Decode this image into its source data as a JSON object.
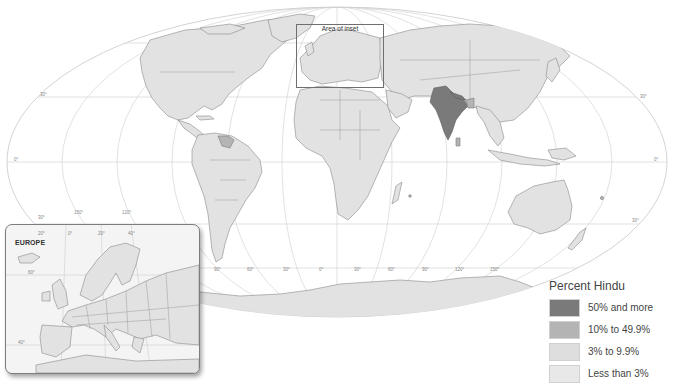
{
  "map": {
    "title": "Percent Hindu",
    "projection": "world ellipse (Mollweide-style)",
    "highlighted_regions": {
      "50% and more": [
        "India",
        "Nepal"
      ],
      "10% to 49.9%": [
        "Bangladesh",
        "Sri Lanka",
        "Guyana",
        "Suriname",
        "Mauritius",
        "Fiji"
      ]
    },
    "area_of_inset_label": "Area of inset",
    "latitude_labels": [
      "30°",
      "0°",
      "30°",
      "30°",
      "0°",
      "30°"
    ],
    "longitude_labels_bottom": [
      "90°",
      "60°",
      "30°",
      "0°",
      "30°",
      "60°",
      "90°",
      "120°",
      "150°"
    ],
    "longitude_labels_left": [
      "150°",
      "120°"
    ],
    "latitude_label_lower_left": "30°"
  },
  "inset": {
    "title": "EUROPE",
    "longitude_labels": [
      "20°",
      "0°",
      "20°",
      "40°"
    ],
    "latitude_labels": [
      "60°",
      "40°"
    ]
  },
  "legend": {
    "title": "Percent Hindu",
    "items": [
      {
        "label": "50% and more",
        "color": "#7a7a7a"
      },
      {
        "label": "10% to 49.9%",
        "color": "#b4b4b4"
      },
      {
        "label": "3% to 9.9%",
        "color": "#dedede"
      },
      {
        "label": "Less than 3%",
        "color": "#e8e8e8"
      }
    ]
  },
  "colors": {
    "land_default": "#e2e2e2",
    "land_50_plus": "#7a7a7a",
    "land_10_to_49": "#b4b4b4",
    "ocean": "#ffffff",
    "graticule": "#cfcfcf"
  }
}
